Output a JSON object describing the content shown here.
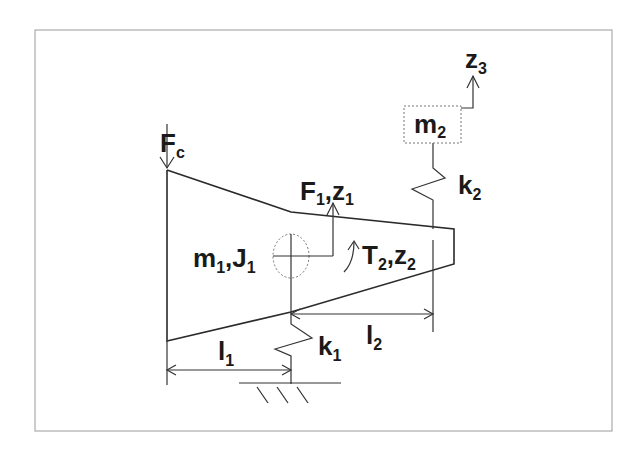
{
  "diagram": {
    "type": "mechanical-model",
    "labels": {
      "force_c": {
        "main": "F",
        "sub": "c"
      },
      "body1": {
        "m": "m",
        "m_sub": "1",
        "sep": ",",
        "J": "J",
        "J_sub": "1"
      },
      "force1": {
        "F": "F",
        "F_sub": "1",
        "sep": ",",
        "z": "z",
        "z_sub": "1"
      },
      "torque2": {
        "T": "T",
        "T_sub": "2",
        "sep": ",",
        "z": "z",
        "z_sub": "2"
      },
      "mass2": {
        "m": "m",
        "m_sub": "2"
      },
      "disp3": {
        "z": "z",
        "z_sub": "3"
      },
      "spring1": {
        "k": "k",
        "k_sub": "1"
      },
      "spring2": {
        "k": "k",
        "k_sub": "2"
      },
      "length1": {
        "l": "l",
        "l_sub": "1"
      },
      "length2": {
        "l": "l",
        "l_sub": "2"
      }
    },
    "colors": {
      "line": "#2a2a2a",
      "frame": "#9a9a9a",
      "background": "#ffffff"
    }
  }
}
